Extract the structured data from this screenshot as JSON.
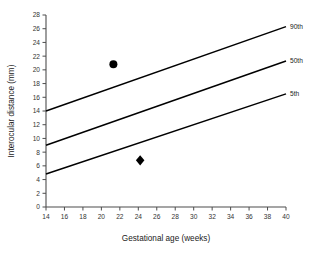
{
  "figure": {
    "caption": ""
  },
  "chart_data": {
    "type": "scatter",
    "title": "",
    "xlabel": "Gestational age (weeks)",
    "ylabel": "Interocular distance (mm)",
    "xlim": [
      14,
      40
    ],
    "ylim": [
      0,
      28
    ],
    "xticks": [
      14,
      16,
      18,
      20,
      22,
      24,
      26,
      28,
      30,
      32,
      34,
      36,
      38,
      40
    ],
    "yticks": [
      0,
      2,
      4,
      6,
      8,
      10,
      12,
      14,
      16,
      18,
      20,
      22,
      24,
      26,
      28
    ],
    "grid": false,
    "legend_position": "right-inline",
    "reference_lines": [
      {
        "name": "90th",
        "label": "90th",
        "x": [
          14,
          40
        ],
        "y": [
          14.0,
          26.3
        ],
        "color": "#000000"
      },
      {
        "name": "50th",
        "label": "50th",
        "x": [
          14,
          40
        ],
        "y": [
          9.0,
          21.3
        ],
        "color": "#000000"
      },
      {
        "name": "5th",
        "label": "5th",
        "x": [
          14,
          40
        ],
        "y": [
          4.8,
          16.5
        ],
        "color": "#000000"
      }
    ],
    "series": [
      {
        "name": "circle-point",
        "marker": "circle",
        "x": [
          21.3
        ],
        "y": [
          20.8
        ],
        "color": "#000000"
      },
      {
        "name": "diamond-point",
        "marker": "diamond",
        "x": [
          24.2
        ],
        "y": [
          6.8
        ],
        "color": "#000000"
      }
    ]
  }
}
